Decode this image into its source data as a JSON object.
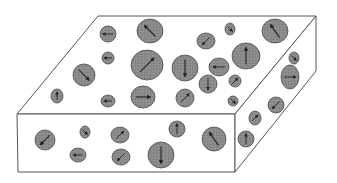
{
  "diagram": {
    "colors": {
      "background": "#ffffff",
      "outline": "#555555",
      "grain_fill": "#8a8a8a",
      "grain_stroke": "#4a4a4a",
      "arrow": "#222222"
    },
    "box": {
      "top_face": [
        [
          17,
          114
        ],
        [
          235,
          114
        ],
        [
          316,
          16
        ],
        [
          98,
          16
        ]
      ],
      "front_face": [
        [
          17,
          114
        ],
        [
          235,
          114
        ],
        [
          235,
          172
        ],
        [
          18,
          172
        ]
      ],
      "right_face": [
        [
          235,
          114
        ],
        [
          316,
          16
        ],
        [
          316,
          71
        ],
        [
          235,
          172
        ]
      ]
    },
    "grains": [
      {
        "face": "top",
        "cx": 108,
        "cy": 34,
        "rx": 8,
        "ry": 8,
        "dir": 180
      },
      {
        "face": "top",
        "cx": 150,
        "cy": 31,
        "rx": 13,
        "ry": 12,
        "dir": 225
      },
      {
        "face": "top",
        "cx": 108,
        "cy": 58,
        "rx": 6,
        "ry": 6,
        "dir": 180
      },
      {
        "face": "top",
        "cx": 147,
        "cy": 65,
        "rx": 16,
        "ry": 15,
        "dir": 315
      },
      {
        "face": "top",
        "cx": 84,
        "cy": 75,
        "rx": 11,
        "ry": 11,
        "dir": 45
      },
      {
        "face": "top",
        "cx": 57,
        "cy": 96,
        "rx": 6,
        "ry": 7,
        "dir": 270
      },
      {
        "face": "top",
        "cx": 108,
        "cy": 101,
        "rx": 7,
        "ry": 6,
        "dir": 180
      },
      {
        "face": "top",
        "cx": 143,
        "cy": 97,
        "rx": 12,
        "ry": 11,
        "dir": 0
      },
      {
        "face": "top",
        "cx": 185,
        "cy": 68,
        "rx": 13,
        "ry": 13,
        "dir": 90
      },
      {
        "face": "top",
        "cx": 206,
        "cy": 41,
        "rx": 9,
        "ry": 8,
        "dir": 135
      },
      {
        "face": "top",
        "cx": 230,
        "cy": 29,
        "rx": 5,
        "ry": 6,
        "dir": 45
      },
      {
        "face": "top",
        "cx": 275,
        "cy": 31,
        "rx": 13,
        "ry": 12,
        "dir": 235
      },
      {
        "face": "top",
        "cx": 219,
        "cy": 67,
        "rx": 10,
        "ry": 9,
        "dir": 180
      },
      {
        "face": "top",
        "cx": 246,
        "cy": 56,
        "rx": 14,
        "ry": 13,
        "dir": 270
      },
      {
        "face": "top",
        "cx": 208,
        "cy": 84,
        "rx": 9,
        "ry": 9,
        "dir": 90
      },
      {
        "face": "top",
        "cx": 235,
        "cy": 81,
        "rx": 6,
        "ry": 6,
        "dir": 315
      },
      {
        "face": "top",
        "cx": 185,
        "cy": 98,
        "rx": 9,
        "ry": 9,
        "dir": 315
      },
      {
        "face": "top",
        "cx": 233,
        "cy": 101,
        "rx": 5,
        "ry": 5,
        "dir": 45
      },
      {
        "face": "right",
        "cx": 294,
        "cy": 58,
        "rx": 5,
        "ry": 6,
        "dir": 45
      },
      {
        "face": "right",
        "cx": 290,
        "cy": 77,
        "rx": 9,
        "ry": 12,
        "dir": 0
      },
      {
        "face": "right",
        "cx": 276,
        "cy": 105,
        "rx": 8,
        "ry": 8,
        "dir": 135
      },
      {
        "face": "right",
        "cx": 255,
        "cy": 118,
        "rx": 6,
        "ry": 7,
        "dir": 315
      },
      {
        "face": "right",
        "cx": 246,
        "cy": 139,
        "rx": 8,
        "ry": 8,
        "dir": 270
      },
      {
        "face": "front",
        "cx": 45,
        "cy": 140,
        "rx": 10,
        "ry": 10,
        "dir": 135
      },
      {
        "face": "front",
        "cx": 85,
        "cy": 132,
        "rx": 5,
        "ry": 6,
        "dir": 45
      },
      {
        "face": "front",
        "cx": 120,
        "cy": 135,
        "rx": 9,
        "ry": 8,
        "dir": 315
      },
      {
        "face": "front",
        "cx": 78,
        "cy": 155,
        "rx": 8,
        "ry": 7,
        "dir": 180
      },
      {
        "face": "front",
        "cx": 121,
        "cy": 157,
        "rx": 9,
        "ry": 8,
        "dir": 135
      },
      {
        "face": "front",
        "cx": 161,
        "cy": 155,
        "rx": 13,
        "ry": 13,
        "dir": 90
      },
      {
        "face": "front",
        "cx": 177,
        "cy": 129,
        "rx": 8,
        "ry": 8,
        "dir": 270
      },
      {
        "face": "front",
        "cx": 214,
        "cy": 139,
        "rx": 12,
        "ry": 12,
        "dir": 235
      }
    ]
  }
}
